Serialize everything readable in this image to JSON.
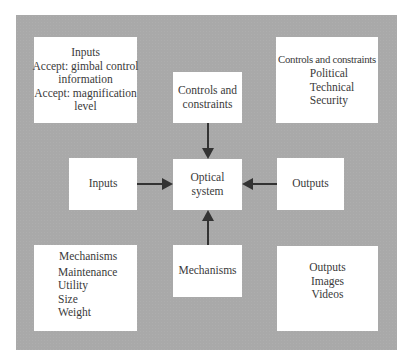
{
  "diagram": {
    "colors": {
      "panel_background": "#a9a9a9",
      "box_background": "#ffffff",
      "text": "#3a3a3a",
      "arrow": "#333333"
    },
    "center": {
      "label_line1": "Optical",
      "label_line2": "system"
    },
    "top_center": {
      "label_line1": "Controls and",
      "label_line2": "constraints"
    },
    "left_center": {
      "label": "Inputs"
    },
    "right_center": {
      "label": "Outputs"
    },
    "bottom_center": {
      "label": "Mechanisms"
    },
    "top_left": {
      "title": "Inputs",
      "lines": [
        "Accept: gimbal control",
        "information",
        "Accept: magnification",
        "level"
      ]
    },
    "top_right": {
      "title": "Controls and constraints",
      "items": [
        "Political",
        "Technical",
        "Security"
      ]
    },
    "bottom_left": {
      "title": "Mechanisms",
      "items": [
        "Maintenance",
        "Utility",
        "Size",
        "Weight"
      ]
    },
    "bottom_right": {
      "title": "Outputs",
      "items": [
        "Images",
        "Videos"
      ]
    },
    "arrows": [
      {
        "from": "Controls and constraints",
        "to": "Optical system",
        "direction": "down"
      },
      {
        "from": "Inputs",
        "to": "Optical system",
        "direction": "right"
      },
      {
        "from": "Outputs",
        "to": "Optical system",
        "direction": "left"
      },
      {
        "from": "Mechanisms",
        "to": "Optical system",
        "direction": "up"
      }
    ]
  }
}
